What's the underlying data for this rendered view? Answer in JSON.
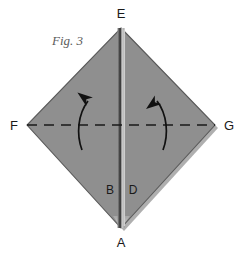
{
  "figure": {
    "caption": "Fig. 3",
    "background_color": "#ffffff",
    "paper_fill": "#8f8f8f",
    "paper_edge_color": "#5a5a5a",
    "shadow_color": "#6e6e6e",
    "crease_dark_color": "#3c3c3c",
    "crease_light_color": "#c9c9c9",
    "label_color": "#1a1a1a",
    "caption_color": "#5b5b5b",
    "dash_line_color": "#1a1a1a",
    "arrow_color": "#111111"
  },
  "vertices": {
    "top": {
      "id": "E",
      "label": "E",
      "x": 121,
      "y": 28
    },
    "left": {
      "id": "F",
      "label": "F",
      "x": 27,
      "y": 125
    },
    "right": {
      "id": "G",
      "label": "G",
      "x": 215,
      "y": 125
    },
    "bottom": {
      "id": "A",
      "label": "A",
      "x": 121,
      "y": 228
    }
  },
  "vertex_labels": [
    {
      "name": "label-E",
      "text": "E",
      "x": 121,
      "y": 18
    },
    {
      "name": "label-F",
      "text": "F",
      "x": 14,
      "y": 130
    },
    {
      "name": "label-G",
      "text": "G",
      "x": 229,
      "y": 130
    },
    {
      "name": "label-A",
      "text": "A",
      "x": 121,
      "y": 247
    }
  ],
  "inner_labels": [
    {
      "name": "label-B",
      "text": "B",
      "x": 110,
      "y": 194
    },
    {
      "name": "label-D",
      "text": "D",
      "x": 133,
      "y": 194
    }
  ],
  "fold_line": {
    "name": "horizontal-fold-dashed-line",
    "style": "dashed",
    "from_x": 27,
    "to_x": 215,
    "y": 125,
    "dash_length": 10,
    "gap_length": 7
  },
  "center_crease": {
    "name": "vertical-center-crease",
    "from_y": 28,
    "to_y": 228,
    "x": 121
  },
  "arrows": [
    {
      "name": "left-fold-arrow",
      "direction": "up",
      "tip_x": 89,
      "tip_y": 96,
      "tail_x": 82,
      "tail_y": 150
    },
    {
      "name": "right-fold-arrow",
      "direction": "up",
      "tip_x": 156,
      "tip_y": 96,
      "tail_x": 163,
      "tail_y": 150
    }
  ]
}
